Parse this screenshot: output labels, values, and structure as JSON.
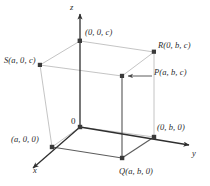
{
  "figure": {
    "colors": {
      "axis": "#2f2f2f",
      "solid_edge": "#5a5a5a",
      "hidden_edge": "#b8b8b8",
      "vertex": "#3a3a3a",
      "text": "#2a2a2a",
      "background": "#ffffff"
    },
    "axes": [
      {
        "id": "axis-x",
        "label": "x"
      },
      {
        "id": "axis-y",
        "label": "y"
      },
      {
        "id": "axis-z",
        "label": "z"
      }
    ],
    "origin": {
      "id": "origin",
      "label": "0"
    },
    "points": [
      {
        "id": "point-0-0-c",
        "label": "(0, 0, c)"
      },
      {
        "id": "point-r",
        "label": "R(0, b, c)"
      },
      {
        "id": "point-s",
        "label": "S(a, 0, c)"
      },
      {
        "id": "point-p",
        "label": "P(a, b, c)"
      },
      {
        "id": "point-a-0-0",
        "label": "(a, 0, 0)"
      },
      {
        "id": "point-0-b-0",
        "label": "(0, b, 0)"
      },
      {
        "id": "point-q",
        "label": "Q(a, b, 0)"
      }
    ]
  }
}
